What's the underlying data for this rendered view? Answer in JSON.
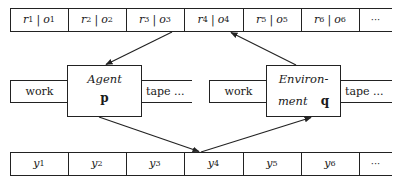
{
  "top_tape": {
    "cells": [
      {
        "r": "r",
        "r_sub": "1",
        "o": "o",
        "o_sub": "1"
      },
      {
        "r": "r",
        "r_sub": "2",
        "o": "o",
        "o_sub": "2"
      },
      {
        "r": "r",
        "r_sub": "3",
        "o": "o",
        "o_sub": "3"
      },
      {
        "r": "r",
        "r_sub": "4",
        "o": "o",
        "o_sub": "4"
      },
      {
        "r": "r",
        "r_sub": "5",
        "o": "o",
        "o_sub": "5"
      },
      {
        "r": "r",
        "r_sub": "6",
        "o": "o",
        "o_sub": "6"
      }
    ],
    "separator": "|",
    "ellipsis": "···"
  },
  "agent": {
    "title": "Agent",
    "variable": "p",
    "work_label": "work",
    "tape_label": "tape ..."
  },
  "environment": {
    "title_line1": "Environ-",
    "title_line2": "ment",
    "variable": "q",
    "work_label": "work",
    "tape_label": "tape ..."
  },
  "bottom_tape": {
    "cells": [
      {
        "y": "y",
        "sub": "1"
      },
      {
        "y": "y",
        "sub": "2"
      },
      {
        "y": "y",
        "sub": "3"
      },
      {
        "y": "y",
        "sub": "4"
      },
      {
        "y": "y",
        "sub": "5"
      },
      {
        "y": "y",
        "sub": "6"
      }
    ],
    "ellipsis": "···"
  },
  "colors": {
    "stroke": "#222222",
    "background": "#ffffff"
  }
}
